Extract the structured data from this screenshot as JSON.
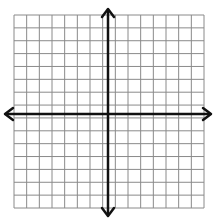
{
  "diagram": {
    "type": "coordinate-grid",
    "grid": {
      "columns": 15,
      "rows": 15,
      "x0": 14,
      "y0": 15,
      "x1": 204,
      "y1": 208,
      "line_color": "#8a8a8a"
    },
    "axes": {
      "x_axis_y": 114,
      "y_axis_x": 108,
      "color": "#111111",
      "x_arrow_left": 5,
      "x_arrow_right": 211,
      "y_arrow_top": 9,
      "y_arrow_bottom": 216
    },
    "labels": []
  }
}
